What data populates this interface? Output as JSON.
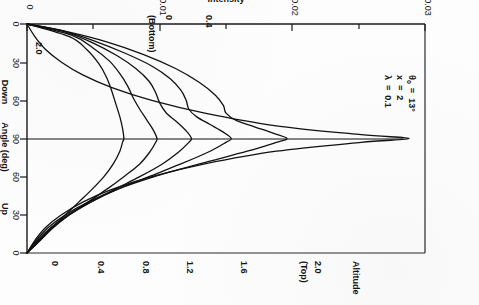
{
  "figure": {
    "orientation_note": "rotated-180",
    "annotation_lines": [
      {
        "symbol": "λ",
        "equals": "=",
        "value": "0.1"
      },
      {
        "symbol": "x",
        "equals": "=",
        "value": "2"
      },
      {
        "symbol": "θ",
        "sub": "o",
        "equals": "=",
        "value": "13°"
      }
    ]
  },
  "chart_data": {
    "type": "line",
    "title": "",
    "xlabel": "Intensity",
    "ylabel": "Angle (deg)",
    "x_ticks": [
      0,
      0.01,
      0.02,
      0.03
    ],
    "x_tick_labels": [
      "0",
      "0.01",
      "0.02",
      "0.03"
    ],
    "xlim": [
      0,
      0.03
    ],
    "y_ticks": [
      0,
      30,
      60,
      90,
      120,
      150,
      180
    ],
    "y_tick_labels": [
      "0",
      "30",
      "60",
      "90",
      "60",
      "30",
      "0"
    ],
    "ylim": [
      0,
      180
    ],
    "y_region_labels": [
      "Up",
      "Down"
    ],
    "grid": false,
    "legend": "inline-curve-labels",
    "series_group_label": "Altitude",
    "top_marker_label": "(Top)",
    "bottom_marker_label": "(Bottom)",
    "series": [
      {
        "name": "2.0",
        "label": "2.0",
        "label_suffix": "(Top)",
        "altitude": 2.0,
        "points": [
          [
            0.0,
            0
          ],
          [
            0.0006,
            10
          ],
          [
            0.0014,
            20
          ],
          [
            0.0026,
            30
          ],
          [
            0.0042,
            40
          ],
          [
            0.0064,
            50
          ],
          [
            0.0094,
            60
          ],
          [
            0.0134,
            70
          ],
          [
            0.0188,
            80
          ],
          [
            0.0252,
            87
          ],
          [
            0.0288,
            90
          ],
          [
            0.0252,
            93
          ],
          [
            0.0188,
            100
          ],
          [
            0.0134,
            110
          ],
          [
            0.0094,
            120
          ],
          [
            0.0064,
            130
          ],
          [
            0.0042,
            140
          ],
          [
            0.0026,
            150
          ],
          [
            0.0014,
            160
          ],
          [
            0.0006,
            170
          ],
          [
            0.0,
            180
          ]
        ]
      },
      {
        "name": "1.6",
        "label": "1.6",
        "altitude": 1.6,
        "points": [
          [
            0.0,
            0
          ],
          [
            0.0007,
            10
          ],
          [
            0.0016,
            20
          ],
          [
            0.0029,
            30
          ],
          [
            0.0046,
            40
          ],
          [
            0.0068,
            50
          ],
          [
            0.0096,
            60
          ],
          [
            0.013,
            70
          ],
          [
            0.0166,
            80
          ],
          [
            0.0188,
            87
          ],
          [
            0.0196,
            90
          ],
          [
            0.0186,
            94
          ],
          [
            0.0172,
            99
          ],
          [
            0.0158,
            104
          ],
          [
            0.015,
            110
          ],
          [
            0.0148,
            116
          ],
          [
            0.0142,
            124
          ],
          [
            0.013,
            134
          ],
          [
            0.0112,
            145
          ],
          [
            0.0088,
            156
          ],
          [
            0.006,
            166
          ],
          [
            0.003,
            174
          ],
          [
            0.0,
            180
          ]
        ]
      },
      {
        "name": "1.2",
        "label": "1.2",
        "altitude": 1.2,
        "points": [
          [
            0.0,
            0
          ],
          [
            0.0008,
            10
          ],
          [
            0.0018,
            20
          ],
          [
            0.0031,
            30
          ],
          [
            0.0048,
            40
          ],
          [
            0.0068,
            50
          ],
          [
            0.0092,
            60
          ],
          [
            0.0116,
            70
          ],
          [
            0.0138,
            80
          ],
          [
            0.015,
            87
          ],
          [
            0.0154,
            90
          ],
          [
            0.0148,
            95
          ],
          [
            0.0138,
            101
          ],
          [
            0.0128,
            107
          ],
          [
            0.0122,
            113
          ],
          [
            0.012,
            120
          ],
          [
            0.0116,
            128
          ],
          [
            0.0108,
            137
          ],
          [
            0.0094,
            147
          ],
          [
            0.0074,
            157
          ],
          [
            0.005,
            167
          ],
          [
            0.0026,
            175
          ],
          [
            0.0,
            180
          ]
        ]
      },
      {
        "name": "0.8",
        "label": "0.8",
        "altitude": 0.8,
        "points": [
          [
            0.0,
            0
          ],
          [
            0.0009,
            10
          ],
          [
            0.0019,
            20
          ],
          [
            0.0032,
            30
          ],
          [
            0.0048,
            40
          ],
          [
            0.0066,
            50
          ],
          [
            0.0085,
            60
          ],
          [
            0.0102,
            70
          ],
          [
            0.0115,
            80
          ],
          [
            0.0122,
            87
          ],
          [
            0.0124,
            90
          ],
          [
            0.012,
            96
          ],
          [
            0.0113,
            103
          ],
          [
            0.0105,
            110
          ],
          [
            0.01,
            118
          ],
          [
            0.0097,
            126
          ],
          [
            0.0092,
            135
          ],
          [
            0.0082,
            145
          ],
          [
            0.0068,
            155
          ],
          [
            0.005,
            165
          ],
          [
            0.0028,
            174
          ],
          [
            0.0,
            180
          ]
        ]
      },
      {
        "name": "0.4",
        "label": "0.4",
        "altitude": 0.4,
        "points": [
          [
            0.0,
            0
          ],
          [
            0.001,
            10
          ],
          [
            0.002,
            20
          ],
          [
            0.0032,
            30
          ],
          [
            0.0046,
            40
          ],
          [
            0.006,
            50
          ],
          [
            0.0073,
            60
          ],
          [
            0.0085,
            70
          ],
          [
            0.0093,
            80
          ],
          [
            0.0097,
            87
          ],
          [
            0.0098,
            90
          ],
          [
            0.0095,
            97
          ],
          [
            0.009,
            105
          ],
          [
            0.0085,
            113
          ],
          [
            0.008,
            122
          ],
          [
            0.0076,
            131
          ],
          [
            0.007,
            141
          ],
          [
            0.0062,
            151
          ],
          [
            0.005,
            161
          ],
          [
            0.0034,
            171
          ],
          [
            0.0,
            180
          ]
        ]
      },
      {
        "name": "0",
        "label": "0",
        "label_suffix": "(Bottom)",
        "altitude": 0.0,
        "points": [
          [
            0.0,
            0
          ],
          [
            0.001,
            10
          ],
          [
            0.0019,
            20
          ],
          [
            0.0029,
            30
          ],
          [
            0.0039,
            40
          ],
          [
            0.0049,
            50
          ],
          [
            0.0058,
            60
          ],
          [
            0.0065,
            70
          ],
          [
            0.007,
            80
          ],
          [
            0.0072,
            87
          ],
          [
            0.0073,
            90
          ],
          [
            0.0072,
            98
          ],
          [
            0.007,
            107
          ],
          [
            0.0067,
            117
          ],
          [
            0.0064,
            127
          ],
          [
            0.006,
            138
          ],
          [
            0.0054,
            149
          ],
          [
            0.0045,
            160
          ],
          [
            0.0032,
            170
          ],
          [
            0.0,
            180
          ]
        ]
      }
    ]
  }
}
